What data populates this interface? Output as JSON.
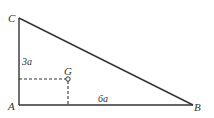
{
  "diagram": {
    "type": "right-triangle",
    "vertices": {
      "A": {
        "label": "A",
        "x": 19,
        "y": 105
      },
      "B": {
        "label": "B",
        "x": 193,
        "y": 105
      },
      "C": {
        "label": "C",
        "x": 19,
        "y": 18
      }
    },
    "centroid": {
      "label": "G",
      "x": 68,
      "y": 79
    },
    "side_labels": {
      "AC": "3a",
      "AB": "6a"
    },
    "colors": {
      "line": "#333333",
      "background": "#ffffff"
    }
  }
}
